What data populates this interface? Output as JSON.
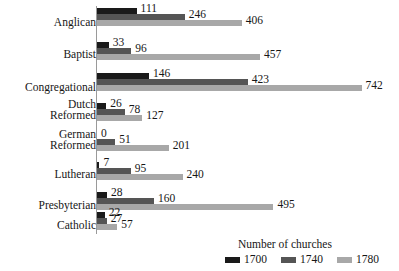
{
  "chart_data": {
    "type": "bar",
    "orientation": "horizontal",
    "title": "",
    "xlabel": "",
    "ylabel": "",
    "grid": false,
    "legend_position": "bottom-right",
    "legend_title": "Number of churches",
    "xlim": [
      0,
      742
    ],
    "categories": [
      "Anglican",
      "Baptist",
      "Congregational",
      "Dutch\nReformed",
      "German\nReformed",
      "Lutheran",
      "Presbyterian",
      "Catholic"
    ],
    "series": [
      {
        "name": "1700",
        "color": "#1a1a1a",
        "values": [
          111,
          33,
          146,
          26,
          0,
          7,
          28,
          22
        ]
      },
      {
        "name": "1740",
        "color": "#555555",
        "values": [
          246,
          96,
          423,
          78,
          51,
          95,
          160,
          27
        ]
      },
      {
        "name": "1780",
        "color": "#a8a8a8",
        "values": [
          406,
          457,
          742,
          127,
          201,
          240,
          495,
          57
        ]
      }
    ]
  },
  "legend": {
    "title": "Number of churches",
    "entries": [
      {
        "label": "1700",
        "color": "#1a1a1a"
      },
      {
        "label": "1740",
        "color": "#555555"
      },
      {
        "label": "1780",
        "color": "#a8a8a8"
      }
    ]
  },
  "colors": {
    "background": "#ffffff",
    "text": "#161616",
    "axis": "#9a9a9a",
    "series_1700": "#1a1a1a",
    "series_1740": "#555555",
    "series_1780": "#a8a8a8"
  }
}
